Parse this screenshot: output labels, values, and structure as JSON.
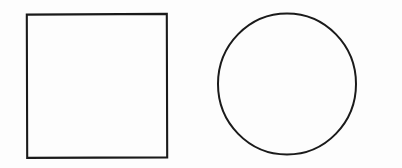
{
  "figure": {
    "background_color": "#fdfdfd",
    "stroke_color": "#1a1a1a",
    "stroke_width": 2,
    "width": 402,
    "height": 168,
    "description": "Two empty outlined geometric shapes side by side on a white background: a square on the left and a circle on the right.",
    "shapes": [
      {
        "name": "square",
        "label": "square",
        "fill": "none",
        "x": 26,
        "y": 14,
        "width": 141,
        "height": 144
      },
      {
        "name": "circle",
        "label": "circle",
        "fill": "none",
        "center_x": 287,
        "center_y": 84,
        "radius_x": 69,
        "radius_y": 70.5
      }
    ]
  }
}
